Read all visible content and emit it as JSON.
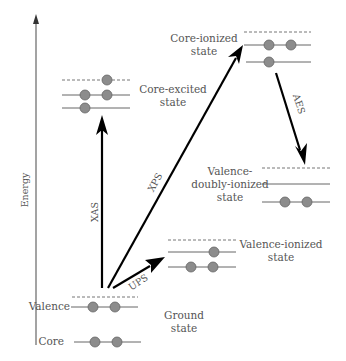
{
  "diagram": {
    "axis": {
      "label": "Energy"
    },
    "states": {
      "ground": {
        "line1": "Ground",
        "line2": "state",
        "valence_label": "Valence",
        "core_label": "Core"
      },
      "core_excited": {
        "line1": "Core-excited",
        "line2": "state"
      },
      "core_ionized": {
        "line1": "Core-ionized",
        "line2": "state"
      },
      "valence_doubly_ionized": {
        "line1": "Valence-",
        "line2": "doubly-ionized",
        "line3": "state"
      },
      "valence_ionized": {
        "line1": "Valence-ionized",
        "line2": "state"
      }
    },
    "processes": {
      "xas": "XAS",
      "xps": "XPS",
      "ups": "UPS",
      "aes": "AES"
    },
    "colors": {
      "electron": "#8c8c8c",
      "arrow": "#000000",
      "text": "#555555"
    }
  }
}
